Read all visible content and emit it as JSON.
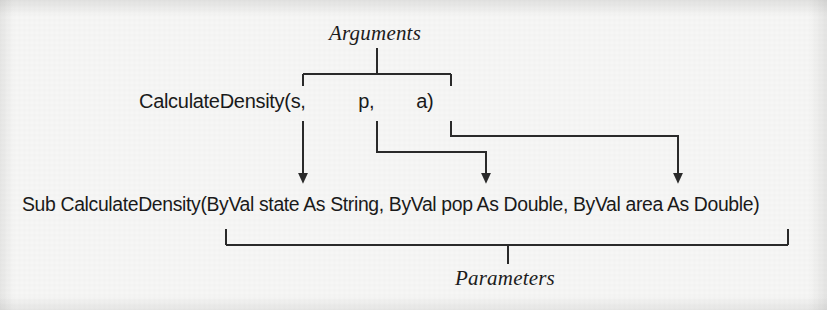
{
  "figure": {
    "kind": "annotated-code-diagram",
    "background_color": "#f7f7f6",
    "ink_color": "#2a2a2a",
    "text_color": "#1a1a1a",
    "labels": {
      "arguments": "Arguments",
      "parameters": "Parameters"
    },
    "code": {
      "call_line": "CalculateDensity(s,          p,        a)",
      "signature_line": "Sub CalculateDensity(ByVal state As String, ByVal pop As Double, ByVal area As Double)"
    },
    "arguments": [
      {
        "name": "s",
        "maps_to": "state"
      },
      {
        "name": "p",
        "maps_to": "pop"
      },
      {
        "name": "a",
        "maps_to": "area"
      }
    ],
    "parameters": [
      {
        "name": "state",
        "type": "String",
        "passing": "ByVal"
      },
      {
        "name": "pop",
        "type": "Double",
        "passing": "ByVal"
      },
      {
        "name": "area",
        "type": "Double",
        "passing": "ByVal"
      }
    ]
  }
}
